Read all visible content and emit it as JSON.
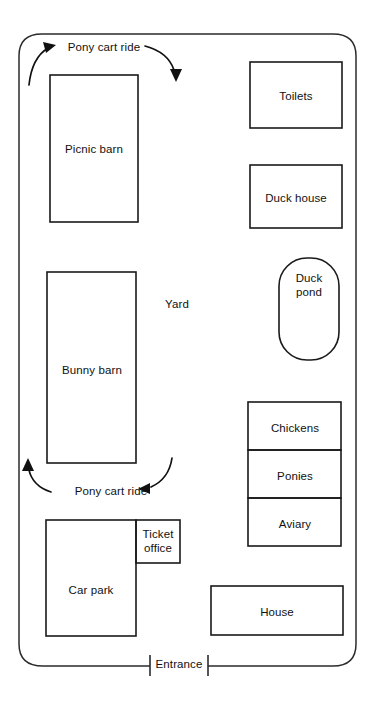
{
  "diagram": {
    "type": "floor-plan-map",
    "background_color": "#ffffff",
    "line_color": "#1a1a1a",
    "text_color": "#111111"
  },
  "boundary": {
    "name": "farm-perimeter",
    "shape": "rounded-rectangle",
    "open_at": "bottom-entrance"
  },
  "open_area": {
    "label": "Yard"
  },
  "buildings": [
    {
      "id": "picnic-barn",
      "label": "Picnic barn",
      "shape": "rectangle"
    },
    {
      "id": "bunny-barn",
      "label": "Bunny barn",
      "shape": "rectangle"
    },
    {
      "id": "toilets",
      "label": "Toilets",
      "shape": "rectangle"
    },
    {
      "id": "duck-house",
      "label": "Duck house",
      "shape": "rectangle"
    },
    {
      "id": "duck-pond",
      "label": "Duck pond",
      "label_line1": "Duck",
      "label_line2": "pond",
      "shape": "stadium"
    },
    {
      "id": "chickens",
      "label": "Chickens",
      "shape": "rectangle"
    },
    {
      "id": "ponies",
      "label": "Ponies",
      "shape": "rectangle"
    },
    {
      "id": "aviary",
      "label": "Aviary",
      "shape": "rectangle"
    },
    {
      "id": "car-park",
      "label": "Car park",
      "shape": "rectangle"
    },
    {
      "id": "ticket-office",
      "label": "Ticket office",
      "label_line1": "Ticket",
      "label_line2": "office",
      "shape": "rectangle"
    },
    {
      "id": "house",
      "label": "House",
      "shape": "rectangle"
    }
  ],
  "routes": [
    {
      "id": "pony-cart-ride-top",
      "label": "Pony cart ride",
      "arrows": [
        {
          "id": "arrow-top-left",
          "direction": "up-right"
        },
        {
          "id": "arrow-top-right",
          "direction": "down"
        }
      ]
    },
    {
      "id": "pony-cart-ride-bottom",
      "label": "Pony cart ride",
      "arrows": [
        {
          "id": "arrow-bottom-left",
          "direction": "up"
        },
        {
          "id": "arrow-bottom-right",
          "direction": "down-left"
        }
      ]
    }
  ],
  "entrance": {
    "label": "Entrance"
  }
}
